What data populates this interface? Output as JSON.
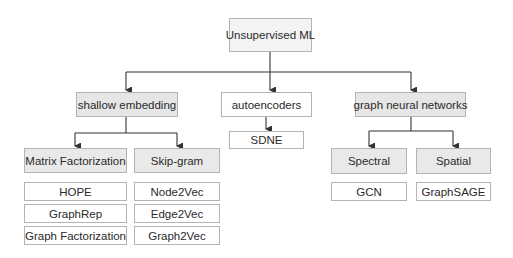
{
  "diagram": {
    "root": {
      "label": "Unsupervised ML"
    },
    "categories": [
      {
        "label": "shallow embedding"
      },
      {
        "label": "autoencoders"
      },
      {
        "label": "graph neural networks"
      }
    ],
    "shallow_embedding": {
      "subcategories": [
        {
          "label": "Matrix Factorization",
          "methods": [
            "HOPE",
            "GraphRep",
            "Graph Factorization"
          ]
        },
        {
          "label": "Skip-gram",
          "methods": [
            "Node2Vec",
            "Edge2Vec",
            "Graph2Vec"
          ]
        }
      ]
    },
    "autoencoders": {
      "methods": [
        "SDNE"
      ]
    },
    "graph_neural_networks": {
      "subcategories": [
        {
          "label": "Spectral",
          "methods": [
            "GCN"
          ]
        },
        {
          "label": "Spatial",
          "methods": [
            "GraphSAGE"
          ]
        }
      ]
    },
    "colors": {
      "root_fill": "#f3f3f3",
      "category_fill": "#e6e6e6",
      "leaf_fill": "#ffffff",
      "border": "#b4b4b4",
      "edge": "#333333"
    }
  }
}
